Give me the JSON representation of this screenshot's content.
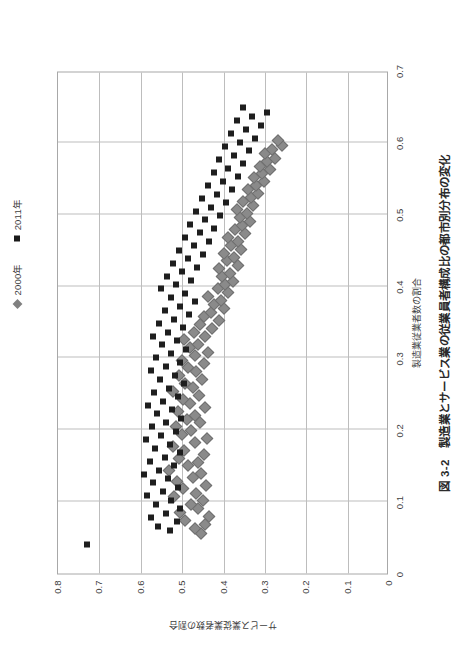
{
  "figure": {
    "title": "図 3-2　製造業とサービス業の従業員者構成比の都市別分布の変化",
    "title_number": "図 3-2",
    "background_color": "#ffffff",
    "frame_color": "#a8a8a8",
    "grid_color": "#bdbdbd"
  },
  "legend": {
    "position": "top-center",
    "entries": [
      {
        "label": "2000年",
        "marker": "diamond-icon",
        "color": "#808080"
      },
      {
        "label": "2011年",
        "marker": "square-icon",
        "color": "#1a1a1a"
      }
    ]
  },
  "axes": {
    "x": {
      "label": "製造業従業者数の割合",
      "ticks": [
        "0",
        "0.1",
        "0.2",
        "0.3",
        "0.4",
        "0.5",
        "0.6",
        "0.7"
      ],
      "min": 0,
      "max": 0.7
    },
    "y": {
      "label": "サービス業従業者数の割合",
      "ticks": [
        "0",
        "0.1",
        "0.2",
        "0.3",
        "0.4",
        "0.5",
        "0.6",
        "0.7",
        "0.8"
      ],
      "min": 0,
      "max": 0.8
    }
  },
  "chart_data": {
    "type": "scatter",
    "title": "図 3-2　製造業とサービス業の従業員者構成比の都市別分布の変化",
    "xlabel": "製造業従業者数の割合",
    "ylabel": "サービス業従業者数の割合",
    "xlim": [
      0,
      0.7
    ],
    "ylim": [
      0,
      0.8
    ],
    "xticks": [
      0,
      0.1,
      0.2,
      0.3,
      0.4,
      0.5,
      0.6,
      0.7
    ],
    "yticks": [
      0,
      0.1,
      0.2,
      0.3,
      0.4,
      0.5,
      0.6,
      0.7,
      0.8
    ],
    "grid": true,
    "legend_position": "top-center",
    "series": [
      {
        "name": "2000年",
        "marker": "diamond",
        "color": "#808080",
        "points": [
          [
            0.055,
            0.455
          ],
          [
            0.062,
            0.47
          ],
          [
            0.068,
            0.444
          ],
          [
            0.074,
            0.492
          ],
          [
            0.079,
            0.436
          ],
          [
            0.085,
            0.505
          ],
          [
            0.09,
            0.462
          ],
          [
            0.096,
            0.478
          ],
          [
            0.101,
            0.449
          ],
          [
            0.107,
            0.519
          ],
          [
            0.112,
            0.466
          ],
          [
            0.118,
            0.498
          ],
          [
            0.122,
            0.442
          ],
          [
            0.128,
            0.512
          ],
          [
            0.133,
            0.474
          ],
          [
            0.139,
            0.455
          ],
          [
            0.144,
            0.531
          ],
          [
            0.15,
            0.486
          ],
          [
            0.155,
            0.462
          ],
          [
            0.16,
            0.508
          ],
          [
            0.166,
            0.448
          ],
          [
            0.171,
            0.495
          ],
          [
            0.177,
            0.523
          ],
          [
            0.182,
            0.47
          ],
          [
            0.188,
            0.44
          ],
          [
            0.193,
            0.501
          ],
          [
            0.199,
            0.478
          ],
          [
            0.204,
            0.516
          ],
          [
            0.21,
            0.456
          ],
          [
            0.215,
            0.488
          ],
          [
            0.22,
            0.47
          ],
          [
            0.226,
            0.509
          ],
          [
            0.231,
            0.444
          ],
          [
            0.237,
            0.482
          ],
          [
            0.242,
            0.498
          ],
          [
            0.248,
            0.46
          ],
          [
            0.253,
            0.521
          ],
          [
            0.259,
            0.474
          ],
          [
            0.264,
            0.492
          ],
          [
            0.27,
            0.452
          ],
          [
            0.275,
            0.507
          ],
          [
            0.281,
            0.466
          ],
          [
            0.286,
            0.486
          ],
          [
            0.292,
            0.448
          ],
          [
            0.297,
            0.5
          ],
          [
            0.303,
            0.47
          ],
          [
            0.308,
            0.438
          ],
          [
            0.314,
            0.48
          ],
          [
            0.319,
            0.462
          ],
          [
            0.325,
            0.496
          ],
          [
            0.33,
            0.444
          ],
          [
            0.336,
            0.472
          ],
          [
            0.341,
            0.428
          ],
          [
            0.347,
            0.458
          ],
          [
            0.352,
            0.412
          ],
          [
            0.358,
            0.446
          ],
          [
            0.363,
            0.43
          ],
          [
            0.369,
            0.398
          ],
          [
            0.374,
            0.422
          ],
          [
            0.38,
            0.406
          ],
          [
            0.385,
            0.438
          ],
          [
            0.391,
            0.388
          ],
          [
            0.396,
            0.414
          ],
          [
            0.402,
            0.396
          ],
          [
            0.407,
            0.376
          ],
          [
            0.413,
            0.404
          ],
          [
            0.418,
            0.384
          ],
          [
            0.424,
            0.412
          ],
          [
            0.429,
            0.366
          ],
          [
            0.435,
            0.392
          ],
          [
            0.44,
            0.374
          ],
          [
            0.446,
            0.4
          ],
          [
            0.451,
            0.358
          ],
          [
            0.457,
            0.382
          ],
          [
            0.462,
            0.364
          ],
          [
            0.468,
            0.39
          ],
          [
            0.473,
            0.348
          ],
          [
            0.479,
            0.372
          ],
          [
            0.484,
            0.356
          ],
          [
            0.49,
            0.336
          ],
          [
            0.496,
            0.36
          ],
          [
            0.501,
            0.344
          ],
          [
            0.507,
            0.368
          ],
          [
            0.512,
            0.328
          ],
          [
            0.518,
            0.352
          ],
          [
            0.523,
            0.334
          ],
          [
            0.529,
            0.316
          ],
          [
            0.534,
            0.34
          ],
          [
            0.54,
            0.322
          ],
          [
            0.545,
            0.302
          ],
          [
            0.551,
            0.326
          ],
          [
            0.556,
            0.308
          ],
          [
            0.562,
            0.288
          ],
          [
            0.567,
            0.312
          ],
          [
            0.573,
            0.294
          ],
          [
            0.578,
            0.276
          ],
          [
            0.584,
            0.3
          ],
          [
            0.59,
            0.282
          ],
          [
            0.596,
            0.258
          ],
          [
            0.603,
            0.268
          ]
        ]
      },
      {
        "name": "2011年",
        "marker": "square",
        "color": "#1a1a1a",
        "points": [
          [
            0.04,
            0.73
          ],
          [
            0.06,
            0.53
          ],
          [
            0.066,
            0.558
          ],
          [
            0.072,
            0.512
          ],
          [
            0.078,
            0.575
          ],
          [
            0.084,
            0.54
          ],
          [
            0.09,
            0.504
          ],
          [
            0.096,
            0.562
          ],
          [
            0.102,
            0.528
          ],
          [
            0.108,
            0.584
          ],
          [
            0.114,
            0.546
          ],
          [
            0.12,
            0.51
          ],
          [
            0.126,
            0.57
          ],
          [
            0.132,
            0.534
          ],
          [
            0.138,
            0.592
          ],
          [
            0.144,
            0.556
          ],
          [
            0.15,
            0.52
          ],
          [
            0.156,
            0.578
          ],
          [
            0.162,
            0.542
          ],
          [
            0.168,
            0.506
          ],
          [
            0.174,
            0.566
          ],
          [
            0.18,
            0.53
          ],
          [
            0.186,
            0.588
          ],
          [
            0.192,
            0.55
          ],
          [
            0.198,
            0.514
          ],
          [
            0.204,
            0.572
          ],
          [
            0.21,
            0.538
          ],
          [
            0.216,
            0.502
          ],
          [
            0.222,
            0.56
          ],
          [
            0.228,
            0.524
          ],
          [
            0.234,
            0.582
          ],
          [
            0.24,
            0.546
          ],
          [
            0.246,
            0.51
          ],
          [
            0.252,
            0.568
          ],
          [
            0.258,
            0.532
          ],
          [
            0.264,
            0.496
          ],
          [
            0.27,
            0.554
          ],
          [
            0.276,
            0.518
          ],
          [
            0.282,
            0.576
          ],
          [
            0.288,
            0.54
          ],
          [
            0.294,
            0.504
          ],
          [
            0.3,
            0.562
          ],
          [
            0.306,
            0.526
          ],
          [
            0.312,
            0.49
          ],
          [
            0.318,
            0.548
          ],
          [
            0.324,
            0.512
          ],
          [
            0.33,
            0.57
          ],
          [
            0.336,
            0.534
          ],
          [
            0.342,
            0.498
          ],
          [
            0.348,
            0.556
          ],
          [
            0.354,
            0.52
          ],
          [
            0.36,
            0.484
          ],
          [
            0.366,
            0.542
          ],
          [
            0.372,
            0.506
          ],
          [
            0.378,
            0.47
          ],
          [
            0.384,
            0.528
          ],
          [
            0.39,
            0.492
          ],
          [
            0.396,
            0.55
          ],
          [
            0.402,
            0.514
          ],
          [
            0.408,
            0.478
          ],
          [
            0.414,
            0.536
          ],
          [
            0.42,
            0.5
          ],
          [
            0.426,
            0.464
          ],
          [
            0.432,
            0.522
          ],
          [
            0.438,
            0.486
          ],
          [
            0.444,
            0.45
          ],
          [
            0.45,
            0.508
          ],
          [
            0.456,
            0.472
          ],
          [
            0.462,
            0.436
          ],
          [
            0.468,
            0.494
          ],
          [
            0.474,
            0.458
          ],
          [
            0.48,
            0.422
          ],
          [
            0.486,
            0.48
          ],
          [
            0.492,
            0.444
          ],
          [
            0.498,
            0.408
          ],
          [
            0.504,
            0.466
          ],
          [
            0.51,
            0.43
          ],
          [
            0.516,
            0.394
          ],
          [
            0.522,
            0.452
          ],
          [
            0.528,
            0.416
          ],
          [
            0.534,
            0.38
          ],
          [
            0.54,
            0.438
          ],
          [
            0.546,
            0.402
          ],
          [
            0.552,
            0.366
          ],
          [
            0.558,
            0.424
          ],
          [
            0.564,
            0.388
          ],
          [
            0.57,
            0.352
          ],
          [
            0.576,
            0.41
          ],
          [
            0.582,
            0.374
          ],
          [
            0.588,
            0.338
          ],
          [
            0.594,
            0.396
          ],
          [
            0.6,
            0.36
          ],
          [
            0.606,
            0.324
          ],
          [
            0.612,
            0.382
          ],
          [
            0.618,
            0.346
          ],
          [
            0.624,
            0.31
          ],
          [
            0.63,
            0.368
          ],
          [
            0.636,
            0.332
          ],
          [
            0.642,
            0.296
          ],
          [
            0.648,
            0.354
          ]
        ]
      }
    ]
  }
}
